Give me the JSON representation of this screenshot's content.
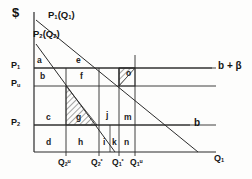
{
  "figure": {
    "axes": {
      "y_axis_label": "$",
      "x_axis_label": "Q₁",
      "y_ticks": [
        {
          "id": "p1",
          "label": "P",
          "sub": "1"
        },
        {
          "id": "pu",
          "label": "P",
          "sub": "u"
        },
        {
          "id": "p2",
          "label": "P",
          "sub": "2"
        }
      ],
      "x_ticks": [
        {
          "id": "q2u",
          "label": "Q",
          "sub": "2",
          "sup": "u"
        },
        {
          "id": "q2s",
          "label": "Q",
          "sub": "2",
          "sup": "*"
        },
        {
          "id": "q1s",
          "label": "Q",
          "sub": "1",
          "sup": "*"
        },
        {
          "id": "q1u",
          "label": "Q",
          "sub": "1",
          "sup": "u"
        }
      ]
    },
    "curves": [
      {
        "id": "demand1",
        "label": "P",
        "sub": "1",
        "arg": "(Q",
        "argsub": "1",
        "argclose": ")"
      },
      {
        "id": "demand2",
        "label": "P",
        "sub": "2",
        "arg": "(Q",
        "argsub": "2",
        "argclose": ")"
      }
    ],
    "horizontal_lines": [
      {
        "id": "cost-upper",
        "label": "b + β"
      },
      {
        "id": "cost-lower",
        "label": "b"
      }
    ],
    "regions": [
      {
        "id": "a",
        "label": "a"
      },
      {
        "id": "e",
        "label": "e"
      },
      {
        "id": "b",
        "label": "b"
      },
      {
        "id": "f",
        "label": "f"
      },
      {
        "id": "o",
        "label": "o"
      },
      {
        "id": "c",
        "label": "c"
      },
      {
        "id": "g",
        "label": "g"
      },
      {
        "id": "j",
        "label": "j"
      },
      {
        "id": "m",
        "label": "m"
      },
      {
        "id": "d",
        "label": "d"
      },
      {
        "id": "h",
        "label": "h"
      },
      {
        "id": "i",
        "label": "i"
      },
      {
        "id": "k",
        "label": "k"
      },
      {
        "id": "n",
        "label": "n"
      }
    ],
    "colors": {
      "stroke": "#2b2b2b",
      "hatch": "#444444",
      "background": "#fdfdfc"
    }
  }
}
